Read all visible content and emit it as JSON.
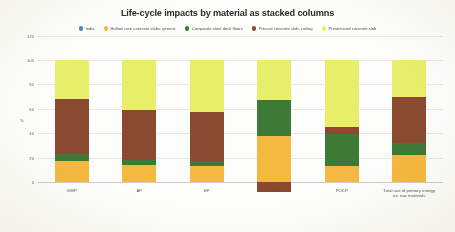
{
  "title": "Life-cycle impacts by material as stacked columns",
  "legend": {
    "items": [
      {
        "label": "India",
        "color": "#4f81bd",
        "icon": "legend-dot-icon"
      },
      {
        "label": "Hollow core concrete slabs, generic",
        "color": "#f5b942",
        "icon": "legend-dot-icon"
      },
      {
        "label": "Composite steel deck floors",
        "color": "#3d7a35",
        "icon": "legend-dot-icon"
      },
      {
        "label": "Precast concrete slab, ceiling",
        "color": "#8b4a2f",
        "icon": "legend-dot-icon"
      },
      {
        "label": "Prestressed concrete slab",
        "color": "#e8ee6a",
        "icon": "legend-dot-icon"
      }
    ]
  },
  "axes": {
    "ylabel": "%",
    "yticks": [
      "120",
      "100",
      "80",
      "60",
      "40",
      "20",
      "0"
    ],
    "ymin": -20,
    "ymax": 120
  },
  "chart_data": {
    "type": "bar",
    "title": "Life-cycle impacts by material as stacked columns",
    "xlabel": "",
    "ylabel": "%",
    "ylim": [
      -20,
      120
    ],
    "grid": true,
    "stacked": true,
    "legend_position": "top-center",
    "categories": [
      "GWP",
      "AP",
      "EP",
      "ODP",
      "POCP",
      "Total use of primary energy ex. raw materials"
    ],
    "category_lines": [
      [
        "GWP"
      ],
      [
        "AP"
      ],
      [
        "EP"
      ],
      [
        "ODP"
      ],
      [
        "POCP"
      ],
      [
        "Total use of primary energy",
        "ex. raw materials"
      ]
    ],
    "series": [
      {
        "name": "India",
        "color": "#4f81bd",
        "values": [
          0,
          0,
          0,
          0,
          0,
          0
        ]
      },
      {
        "name": "Hollow core concrete slabs, generic",
        "color": "#f5b942",
        "values": [
          17,
          14,
          13,
          38,
          13,
          22
        ]
      },
      {
        "name": "Composite steel deck floors",
        "color": "#3d7a35",
        "values": [
          6,
          4,
          4,
          29,
          26,
          10
        ]
      },
      {
        "name": "Precast concrete slab, ceiling",
        "color": "#8b4a2f",
        "values": [
          45,
          41,
          40,
          -8,
          6,
          38
        ]
      },
      {
        "name": "Prestressed concrete slab",
        "color": "#e8ee6a",
        "values": [
          32,
          41,
          43,
          33,
          55,
          30
        ]
      }
    ]
  }
}
